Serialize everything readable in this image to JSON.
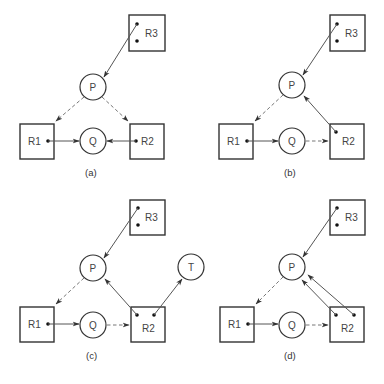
{
  "panels": [
    {
      "caption": "(a)",
      "nodes": {
        "R3": {
          "label": "R3",
          "type": "resource",
          "dots": 2
        },
        "P": {
          "label": "P",
          "type": "process"
        },
        "R1": {
          "label": "R1",
          "type": "resource",
          "dots": 1
        },
        "Q": {
          "label": "Q",
          "type": "process"
        },
        "R2": {
          "label": "R2",
          "type": "resource",
          "dots": 1
        }
      },
      "edges": [
        {
          "from": "R3",
          "to": "P",
          "style": "solid"
        },
        {
          "from": "P",
          "to": "R1",
          "style": "dashed"
        },
        {
          "from": "P",
          "to": "R2",
          "style": "dashed"
        },
        {
          "from": "R1",
          "to": "Q",
          "style": "solid"
        },
        {
          "from": "R2",
          "to": "Q",
          "style": "solid"
        }
      ]
    },
    {
      "caption": "(b)",
      "nodes": {
        "R3": {
          "label": "R3",
          "type": "resource",
          "dots": 2
        },
        "P": {
          "label": "P",
          "type": "process"
        },
        "R1": {
          "label": "R1",
          "type": "resource",
          "dots": 1
        },
        "Q": {
          "label": "Q",
          "type": "process"
        },
        "R2": {
          "label": "R2",
          "type": "resource",
          "dots": 1
        }
      },
      "edges": [
        {
          "from": "R3",
          "to": "P",
          "style": "solid"
        },
        {
          "from": "P",
          "to": "R1",
          "style": "dashed"
        },
        {
          "from": "R1",
          "to": "Q",
          "style": "solid"
        },
        {
          "from": "Q",
          "to": "R2",
          "style": "dashed"
        },
        {
          "from": "R2",
          "to": "P",
          "style": "solid"
        }
      ]
    },
    {
      "caption": "(c)",
      "nodes": {
        "R3": {
          "label": "R3",
          "type": "resource",
          "dots": 2
        },
        "P": {
          "label": "P",
          "type": "process"
        },
        "T": {
          "label": "T",
          "type": "process"
        },
        "R1": {
          "label": "R1",
          "type": "resource",
          "dots": 1
        },
        "Q": {
          "label": "Q",
          "type": "process"
        },
        "R2": {
          "label": "R2",
          "type": "resource",
          "dots": 2
        }
      },
      "edges": [
        {
          "from": "R3",
          "to": "P",
          "style": "solid"
        },
        {
          "from": "P",
          "to": "R1",
          "style": "dashed"
        },
        {
          "from": "R1",
          "to": "Q",
          "style": "solid"
        },
        {
          "from": "Q",
          "to": "R2",
          "style": "dashed"
        },
        {
          "from": "R2",
          "to": "P",
          "style": "solid"
        },
        {
          "from": "R2",
          "to": "T",
          "style": "solid"
        }
      ]
    },
    {
      "caption": "(d)",
      "nodes": {
        "R3": {
          "label": "R3",
          "type": "resource",
          "dots": 2
        },
        "P": {
          "label": "P",
          "type": "process"
        },
        "R1": {
          "label": "R1",
          "type": "resource",
          "dots": 1
        },
        "Q": {
          "label": "Q",
          "type": "process"
        },
        "R2": {
          "label": "R2",
          "type": "resource",
          "dots": 2
        }
      },
      "edges": [
        {
          "from": "R3",
          "to": "P",
          "style": "solid"
        },
        {
          "from": "P",
          "to": "R1",
          "style": "dashed"
        },
        {
          "from": "R1",
          "to": "Q",
          "style": "solid"
        },
        {
          "from": "Q",
          "to": "R2",
          "style": "dashed"
        },
        {
          "from": "R2",
          "to": "P",
          "style": "solid"
        },
        {
          "from": "R2",
          "to": "P",
          "style": "solid"
        }
      ]
    }
  ]
}
